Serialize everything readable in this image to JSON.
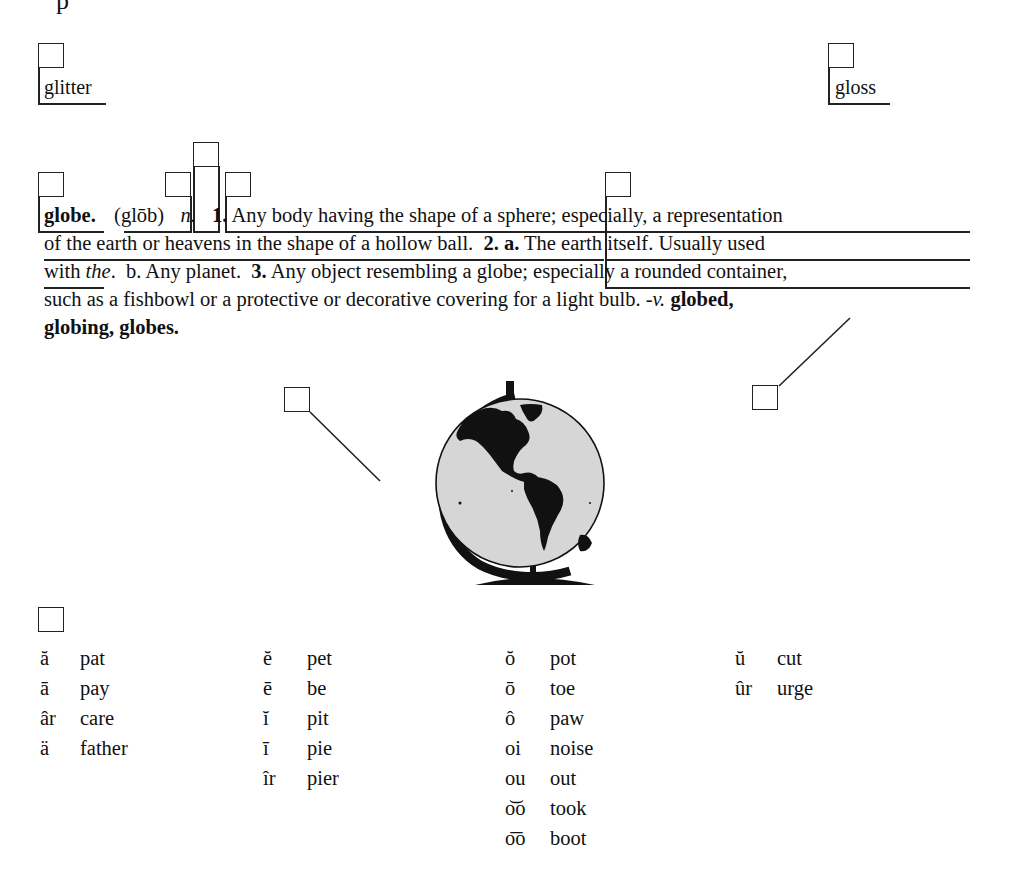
{
  "page": {
    "top_fragment": "p"
  },
  "guide_words": {
    "left": "glitter",
    "right": "gloss"
  },
  "entry": {
    "headword": "globe.",
    "pronunciation": "(glōb)",
    "part_of_speech": "n.",
    "lines": [
      {
        "segments": [
          {
            "text": "1.",
            "style": "bold"
          },
          {
            "text": " Any body having the shape of a sphere; especially, a representation",
            "style": "normal"
          }
        ]
      },
      {
        "segments": [
          {
            "text": "of the earth or heavens in the shape of a hollow ball.  ",
            "style": "normal"
          },
          {
            "text": "2. a.",
            "style": "bold"
          },
          {
            "text": " The earth itself. Usually used",
            "style": "normal"
          }
        ]
      },
      {
        "segments": [
          {
            "text": "with ",
            "style": "normal"
          },
          {
            "text": "the",
            "style": "italic"
          },
          {
            "text": ".  b. Any planet.  ",
            "style": "normal"
          },
          {
            "text": "3.",
            "style": "bold"
          },
          {
            "text": " Any object resembling a globe; especially a rounded container,",
            "style": "normal"
          }
        ]
      },
      {
        "segments": [
          {
            "text": "such as a fishbowl or a protective or decorative covering for a light bulb. ",
            "style": "normal"
          },
          {
            "text": "-v.",
            "style": "italic"
          },
          {
            "text": " ",
            "style": "normal"
          },
          {
            "text": "globed,",
            "style": "bold"
          }
        ]
      },
      {
        "segments": [
          {
            "text": "globing, globes.",
            "style": "bold"
          }
        ]
      }
    ]
  },
  "illustration": {
    "name": "globe-on-stand",
    "ocean_color": "#d6d6d6",
    "land_color": "#111111"
  },
  "label_boxes": {
    "guide_word_left": "",
    "guide_word_right": "",
    "entry_word": "",
    "pronunciation": "",
    "part_of_speech": "",
    "definition": "",
    "second_definition": "",
    "picture": "",
    "inflected_forms": "",
    "pronunciation_key": ""
  },
  "pronunciation_key": {
    "columns": [
      [
        {
          "symbol": "ă",
          "word": "pat"
        },
        {
          "symbol": "ā",
          "word": "pay"
        },
        {
          "symbol": "âr",
          "word": "care"
        },
        {
          "symbol": "ä",
          "word": "father"
        }
      ],
      [
        {
          "symbol": "ĕ",
          "word": "pet"
        },
        {
          "symbol": "ē",
          "word": "be"
        },
        {
          "symbol": "ĭ",
          "word": "pit"
        },
        {
          "symbol": "ī",
          "word": "pie"
        },
        {
          "symbol": "îr",
          "word": "pier"
        }
      ],
      [
        {
          "symbol": "ŏ",
          "word": "pot"
        },
        {
          "symbol": "ō",
          "word": "toe"
        },
        {
          "symbol": "ô",
          "word": "paw"
        },
        {
          "symbol": "oi",
          "word": "noise"
        },
        {
          "symbol": "ou",
          "word": "out"
        },
        {
          "symbol": "o͝o",
          "word": "took"
        },
        {
          "symbol": "o͞o",
          "word": "boot"
        }
      ],
      [
        {
          "symbol": "ŭ",
          "word": "cut"
        },
        {
          "symbol": "ûr",
          "word": "urge"
        }
      ]
    ]
  }
}
